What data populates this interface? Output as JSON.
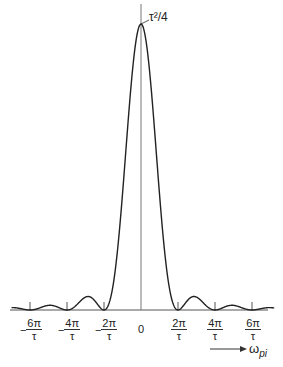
{
  "chart_data": {
    "type": "line",
    "title": "",
    "function": "(τ²/4)·sinc²(ωτ/2)",
    "xlabel": "ω_pi",
    "ylabel": "",
    "peak_label": "τ²/4",
    "x_ticks": [
      {
        "label_num": "6π",
        "label_den": "τ",
        "neg": true,
        "value": -6
      },
      {
        "label_num": "4π",
        "label_den": "τ",
        "neg": true,
        "value": -4
      },
      {
        "label_num": "2π",
        "label_den": "τ",
        "neg": true,
        "value": -2
      },
      {
        "label": "0",
        "value": 0
      },
      {
        "label_num": "2π",
        "label_den": "τ",
        "neg": false,
        "value": 2
      },
      {
        "label_num": "4π",
        "label_den": "τ",
        "neg": false,
        "value": 4
      },
      {
        "label_num": "6π",
        "label_den": "τ",
        "neg": false,
        "value": 6
      }
    ],
    "x_units": "π/τ",
    "xlim": [
      -7,
      7.2
    ],
    "ylim": [
      0,
      1
    ],
    "peak_value": 1,
    "zeros": [
      -6,
      -4,
      -2,
      2,
      4,
      6
    ],
    "side_lobe_relative_heights": [
      0.047,
      0.016,
      0.008
    ],
    "grid": false,
    "legend": null
  },
  "labels": {
    "peak": "τ²/4",
    "zero": "0",
    "axis_omega": "ω",
    "axis_sub": "pi",
    "minus": "−",
    "tick_m6_num": "6π",
    "tick_m6_den": "τ",
    "tick_m4_num": "4π",
    "tick_m4_den": "τ",
    "tick_m2_num": "2π",
    "tick_m2_den": "τ",
    "tick_p2_num": "2π",
    "tick_p2_den": "τ",
    "tick_p4_num": "4π",
    "tick_p4_den": "τ",
    "tick_p6_num": "6π",
    "tick_p6_den": "τ"
  },
  "colors": {
    "line": "#222222",
    "axis": "#555555",
    "background": "#ffffff"
  }
}
